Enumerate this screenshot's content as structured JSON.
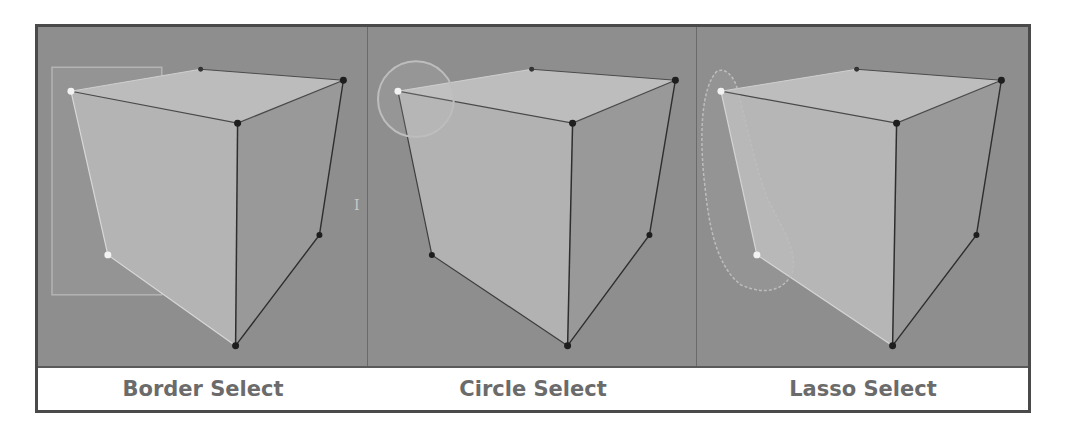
{
  "figure": {
    "panels": [
      {
        "id": "border",
        "label": "Border Select",
        "selection_tool": "border",
        "selected_vertices": 2,
        "width": 330
      },
      {
        "id": "circle",
        "label": "Circle Select",
        "selection_tool": "circle",
        "selected_vertices": 1,
        "width": 328
      },
      {
        "id": "lasso",
        "label": "Lasso Select",
        "selection_tool": "lasso",
        "selected_vertices": 2,
        "width": 332
      }
    ],
    "colors": {
      "viewport_bg": "#8e8e8e",
      "cube_face_light": "#b8b8b8",
      "cube_face_mid": "#a6a6a6",
      "cube_face_dark": "#999999",
      "vertex_selected": "#f2f2f2",
      "vertex_unselected": "#1e1e1e",
      "edge": "#3a3a3a",
      "label_text": "#6b6b6b",
      "frame": "#4a4a4a"
    },
    "cursor_glyph": "I"
  }
}
